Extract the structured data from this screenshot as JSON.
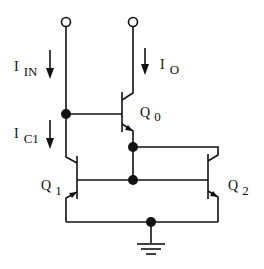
{
  "diagram": {
    "title": "",
    "type": "current-mirror-circuit",
    "labels": {
      "i_in": {
        "main": "I",
        "sub": "IN"
      },
      "i_o": {
        "main": "I",
        "sub": "O"
      },
      "i_c1": {
        "main": "I",
        "sub": "C1"
      },
      "q0": {
        "main": "Q",
        "sub": "0"
      },
      "q1": {
        "main": "Q",
        "sub": "1"
      },
      "q2": {
        "main": "Q",
        "sub": "2"
      }
    },
    "components": [
      {
        "id": "Q0",
        "kind": "npn-transistor"
      },
      {
        "id": "Q1",
        "kind": "npn-transistor"
      },
      {
        "id": "Q2",
        "kind": "npn-transistor"
      },
      {
        "id": "GND",
        "kind": "ground"
      }
    ],
    "terminals": [
      "input-terminal",
      "output-terminal"
    ],
    "colors": {
      "ink": "#111111",
      "background": "#ffffff"
    }
  }
}
